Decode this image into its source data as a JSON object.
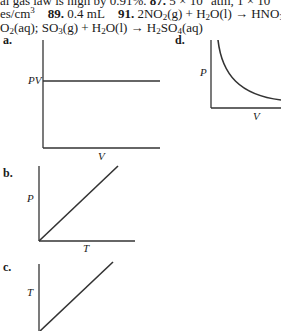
{
  "text": {
    "line1": "al gas law is high by 0.91%.",
    "line1_b": "87.",
    "line1_c": "5 × 10",
    "line1_d": "atm, 1 × 10",
    "line2_a": "es/cm",
    "line2_b": "89.",
    "line2_c": "0.4 mL",
    "line2_d": "91.",
    "line2_e": "2NO",
    "line2_f": "(g) + H",
    "line2_g": "O(l) → HNO",
    "line2_h": "(a",
    "line3_a": "O",
    "line3_b": "(aq); SO",
    "line3_c": "(g) + H",
    "line3_d": "O(l) → H",
    "line3_e": "SO",
    "line3_f": "(aq)"
  },
  "graphs": {
    "a": {
      "label": "a.",
      "ylabel": "PV",
      "xlabel": "V"
    },
    "b": {
      "label": "b.",
      "ylabel": "P",
      "xlabel": "T"
    },
    "c": {
      "label": "c.",
      "ylabel": "T",
      "xlabel": ""
    },
    "d": {
      "label": "d.",
      "ylabel": "P",
      "xlabel": "V"
    }
  }
}
